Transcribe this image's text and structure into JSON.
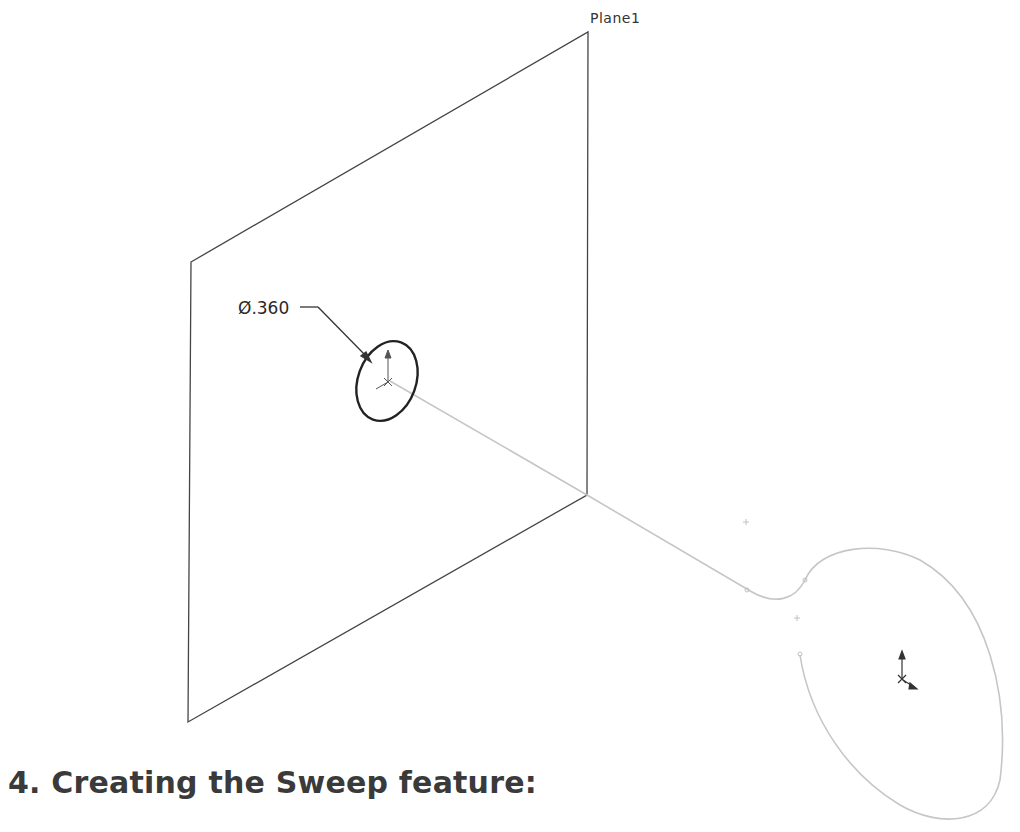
{
  "drawing": {
    "plane_label": "Plane1",
    "dimension_label": "Ø.360",
    "plane_corners": [
      [
        191,
        262
      ],
      [
        588,
        32
      ],
      [
        587,
        495
      ],
      [
        188,
        722
      ]
    ],
    "profile_circle": {
      "cx": 387,
      "cy": 381,
      "rx": 29,
      "ry": 41,
      "rotate": 20
    },
    "sweep_path": "M 390 381 L 587 495 L 752 592 C 775 605, 795 600, 805 580 C 820 545, 880 540, 920 560 C 990 600, 1010 700, 1000 780 C 990 825, 940 828, 900 805 C 850 775, 810 720, 800 655",
    "colors": {
      "plane": "#444444",
      "profile": "#222222",
      "path": "#c8c8c8",
      "axis": "#333333"
    }
  },
  "text": {
    "section_heading": "4. Creating the Sweep feature:"
  }
}
